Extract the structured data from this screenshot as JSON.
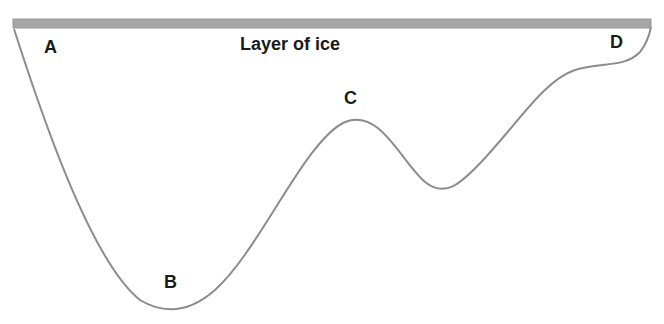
{
  "diagram": {
    "title": "Layer of ice",
    "points": [
      {
        "id": "A",
        "label": "A"
      },
      {
        "id": "B",
        "label": "B"
      },
      {
        "id": "C",
        "label": "C"
      },
      {
        "id": "D",
        "label": "D"
      }
    ],
    "colors": {
      "ice_layer": "#a6a6a6",
      "ice_layer_border": "#8c8c8c",
      "curve": "#8c8c8c",
      "text": "#1a1a1a",
      "background": "#ffffff"
    }
  }
}
